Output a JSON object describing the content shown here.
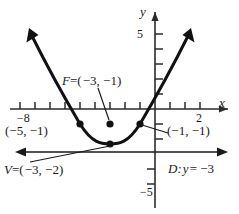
{
  "figure": {
    "type": "parabola-graph",
    "axes": {
      "x_axis_label": "x",
      "y_axis_label": "y",
      "x_tick_labels": [
        {
          "text": "−8",
          "value": -8
        },
        {
          "text": "2",
          "value": 2
        }
      ],
      "y_tick_labels": [
        {
          "text": "5",
          "value": 5
        },
        {
          "text": "−5",
          "value": -5
        }
      ],
      "x_origin_px": 155,
      "y_origin_px": 109,
      "px_per_unit": 15,
      "x_range": [
        -9,
        3.5
      ],
      "y_range": [
        -6.5,
        5.5
      ]
    },
    "curve": {
      "kind": "parabola",
      "opens": "up",
      "vertex": [
        -3,
        -2
      ],
      "focus": [
        -3,
        -1
      ],
      "four_p": 4,
      "equation": "(x+3)^2 = 4(y+2)"
    },
    "points": [
      {
        "name": "focus",
        "x": -3,
        "y": -1
      },
      {
        "name": "vertex",
        "x": -3,
        "y": -2
      },
      {
        "name": "latus-left",
        "x": -5,
        "y": -1
      },
      {
        "name": "latus-right",
        "x": -1,
        "y": -1
      }
    ],
    "directrix": {
      "y": -3,
      "label": "D: y = −3"
    },
    "annotations": {
      "focus_label": "F = (−3,  −1)",
      "focus_label_parts": {
        "name": "F",
        "eq": "=",
        "open": "(",
        "x": "−3,",
        "y": "−1",
        "close": ")"
      },
      "vertex_label": "V = (−3,  −2)",
      "vertex_label_parts": {
        "name": "V",
        "eq": "=",
        "open": "(",
        "x": "−3,",
        "y": "−2",
        "close": ")"
      },
      "left_point_label": "(−5,  −1)",
      "right_point_label": "(−1,  −1)",
      "directrix_label_parts": {
        "name": "D:",
        "var": "y",
        "eq": "=",
        "value": "−3"
      }
    },
    "colors": {
      "ink": "#1a1a1a",
      "curve": "#111111",
      "axis": "#2b2b2b",
      "background": "#ffffff"
    }
  }
}
